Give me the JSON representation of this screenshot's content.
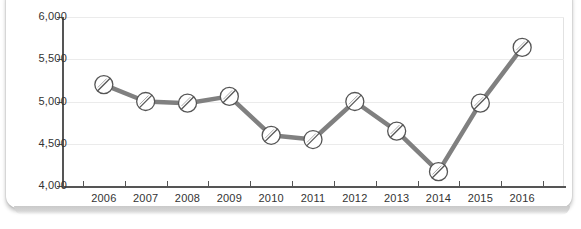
{
  "chart_data": {
    "type": "line",
    "title": "",
    "subtitle": "",
    "xlabel": "",
    "ylabel": "",
    "categories": [
      "2006",
      "2007",
      "2008",
      "2009",
      "2010",
      "2011",
      "2012",
      "2013",
      "2014",
      "2015",
      "2016"
    ],
    "values": [
      5200,
      5000,
      4980,
      5060,
      4600,
      4550,
      5000,
      4650,
      4170,
      4980,
      5640
    ],
    "series": [
      {
        "name": "",
        "values": [
          5200,
          5000,
          4980,
          5060,
          4600,
          4550,
          5000,
          4650,
          4170,
          4980,
          5640
        ]
      }
    ],
    "ylim": [
      4000,
      6000
    ],
    "ytick_values": [
      4000,
      4500,
      5000,
      5500,
      6000
    ],
    "ytick_labels": [
      "4,000",
      "4,500",
      "5,000",
      "5,500",
      "6,000"
    ],
    "xtick_labels": [
      "2006",
      "2007",
      "2008",
      "2009",
      "2010",
      "2011",
      "2012",
      "2013",
      "2014",
      "2015",
      "2016"
    ],
    "grid": true,
    "grid_axis": "y",
    "legend": false,
    "legend_position": "none",
    "annotations": [],
    "marker": "slashed-circle",
    "line_color": "#808080",
    "marker_fill": "#ffffff",
    "marker_edge": "#555555",
    "grid_color": "#ebebeb",
    "axis_color": "#555555",
    "plot_background": "#ffffff",
    "card_background": "#ffffff"
  }
}
